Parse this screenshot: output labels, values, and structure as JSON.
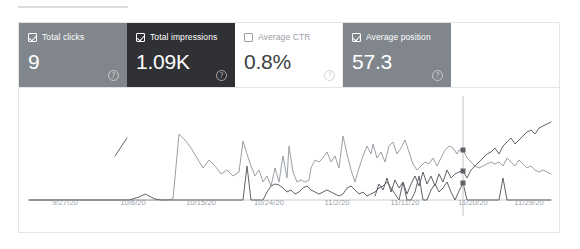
{
  "panel": {
    "tab_underline": "active-tab-indicator"
  },
  "metrics": [
    {
      "id": "total-clicks",
      "label": "Total clicks",
      "value": "9",
      "selected": true,
      "style": "gray",
      "checkbox": "checked",
      "help": "?",
      "color": "#80868b"
    },
    {
      "id": "total-impressions",
      "label": "Total impressions",
      "value": "1.09K",
      "selected": true,
      "style": "dark",
      "checkbox": "checked",
      "help": "?",
      "color": "#303134"
    },
    {
      "id": "average-ctr",
      "label": "Average CTR",
      "value": "0.8%",
      "selected": false,
      "style": "white",
      "checkbox": "unchecked",
      "help": "?",
      "color": "#ffffff"
    },
    {
      "id": "average-position",
      "label": "Average position",
      "value": "57.3",
      "selected": true,
      "style": "gray",
      "checkbox": "checked",
      "help": "?",
      "color": "#80868b"
    }
  ],
  "chart_data": {
    "type": "line",
    "title": "",
    "xlabel": "",
    "ylabel": "",
    "grid": false,
    "legend": "none",
    "x_tick_labels": [
      "9/27/20",
      "10/6/20",
      "10/15/20",
      "10/24/20",
      "11/2/20",
      "11/11/20",
      "11/20/20",
      "11/29/20"
    ],
    "x_tick_positions": [
      46,
      114,
      182,
      250,
      318,
      386,
      454,
      510
    ],
    "x_range": [
      "9/27/20",
      "12/5/20"
    ],
    "hover": {
      "x": 434,
      "markers": [
        {
          "series": "Total impressions",
          "y": 54
        },
        {
          "series": "Average position",
          "y": 75
        },
        {
          "series": "Total clicks",
          "y": 87
        }
      ]
    },
    "series": [
      {
        "name": "Total impressions",
        "color": "#9aa0a6",
        "width": 1,
        "points": "0,104 8,104 16,104 24,104 32,104 40,104 48,104 56,104 64,104 72,104 80,104 88,104 96,104 104,104 112,104 120,104 128,104 136,104 144,103 150,38 156,44 162,52 168,62 174,72 180,64 186,70 192,78 198,74 204,80 210,76 214,45 218,58 222,70 226,80 230,74 234,86 238,80 242,90 246,72 250,86 254,60 258,82 260,50 264,76 268,86 272,84 276,86 280,84 282,72 286,64 290,66 294,62 298,56 302,66 306,60 310,72 314,40 318,58 322,74 326,86 330,72 334,60 338,50 342,58 344,48 348,62 352,56 356,66 360,50 364,46 368,58 372,52 376,44 380,56 384,68 388,74 392,70 396,66 400,68 404,62 408,70 412,62 416,54 420,50 424,52 428,58 430,54 434,54 438,62 442,66 446,70 450,72 454,70 458,68 462,66 466,68 470,66 474,70 478,62 482,66 486,70 490,64 494,68 498,72 502,70 506,74 510,76 514,74 518,76 522,78"
      },
      {
        "name": "Average position",
        "color": "#5f6368",
        "width": 1,
        "gap_note": "sparse series with breaks, sharp rise at right",
        "segments": [
          "86,60 98,42",
          "346,100 350,88 354,94 358,82 362,96 366,84 370,92 374,86 378,98 382,88 386,80 390,90 394,76 398,88 402,80 406,90 410,78 414,86 418,74 422,82 426,78 430,76 434,75 438,82 442,74 446,70 450,66 454,62 458,58 462,56 466,52 470,58 474,50 478,46 482,42 486,48 490,44 494,40 498,36 502,34 506,38 510,32 514,30 518,28 522,26"
        ]
      },
      {
        "name": "Total clicks",
        "color": "#5f6368",
        "width": 1,
        "points": "0,104 20,104 40,104 60,104 80,104 100,104 110,101 116,98 120,100 126,103 132,104 140,104 150,104 160,104 170,104 180,104 190,104 200,104 210,104 214,104 218,70 222,104 226,104 230,104 234,104 238,96 242,90 246,88 250,89 254,92 258,96 262,94 266,98 270,96 274,92 278,90 282,94 286,96 290,98 294,96 298,94 302,96 306,98 310,100 314,98 318,92 322,90 326,94 330,98 334,96 338,100 342,98 346,96 350,92 354,90 358,86 362,92 366,98 370,104 374,86 378,104 382,104 386,96 390,80 394,104 398,104 402,94 406,88 410,96 414,92 418,86 422,96 426,104 430,95 434,87 438,104 442,104 446,104 450,104 454,104 458,104 462,104 466,104 470,104 474,82 478,104 482,104 486,104 490,104 494,104 498,104 502,104 506,104 510,104 514,104 518,104 522,104"
      }
    ],
    "baseline": {
      "y": 104,
      "color": "#c8ccd0"
    }
  }
}
